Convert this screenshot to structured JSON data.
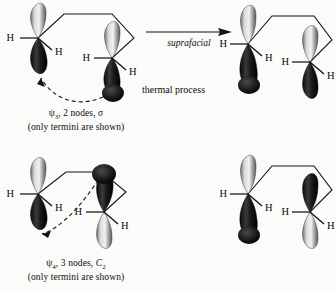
{
  "figure": {
    "background_color": "#fbfbf9",
    "ink_color": "#0d0d0d"
  },
  "rows": [
    {
      "id": "suprafacial",
      "reactant": {
        "name": "psi-3 orbital diagram",
        "caption_line1": "ψ3, 2 nodes, σ",
        "caption_line2": "(only termini are shown)",
        "orbital_symbol": "ψ3",
        "nodes": "2 nodes",
        "symmetry": "σ",
        "left_terminus": {
          "h_labels": [
            "H",
            "H"
          ],
          "top_lobe": "light",
          "bottom_lobe": "dark"
        },
        "right_terminus": {
          "h_labels": [
            "H",
            "H"
          ],
          "top_lobe": "light",
          "bottom_lobe": "dark"
        },
        "curved_arrow": "bond-formation-arrow"
      },
      "arrow": {
        "label": "suprafacial",
        "direction": "right"
      },
      "product": {
        "name": "suprafacial product orbital diagram",
        "left_terminus": {
          "h_labels": [
            "H",
            "H"
          ],
          "top_lobe": "light",
          "bottom_lobe": "dark"
        },
        "right_terminus": {
          "h_labels": [
            "H",
            "H"
          ],
          "top_lobe": "light",
          "bottom_lobe": "dark"
        }
      }
    },
    {
      "id": "antarafacial",
      "reactant": {
        "name": "psi-4 orbital diagram",
        "caption_line1": "ψ4, 3 nodes, C2",
        "caption_line2": "(only termini are shown)",
        "orbital_symbol": "ψ4",
        "nodes": "3 nodes",
        "symmetry": "C2",
        "left_terminus": {
          "h_labels": [
            "H",
            "H"
          ],
          "top_lobe": "light",
          "bottom_lobe": "dark"
        },
        "right_terminus": {
          "h_labels": [
            "H",
            "H"
          ],
          "top_lobe": "dark",
          "bottom_lobe": "light"
        },
        "curved_arrow": "bond-formation-arrow"
      },
      "arrow": {
        "label": "antarafacial",
        "direction": "right"
      },
      "product": {
        "name": "antarafacial product orbital diagram",
        "left_terminus": {
          "h_labels": [
            "H",
            "H"
          ],
          "top_lobe": "light",
          "bottom_lobe": "dark"
        },
        "right_terminus": {
          "h_labels": [
            "H",
            "H"
          ],
          "top_lobe": "dark",
          "bottom_lobe": "light"
        }
      }
    }
  ],
  "notes": {
    "thermal_process": "thermal process"
  },
  "labels": {
    "h": "H"
  }
}
